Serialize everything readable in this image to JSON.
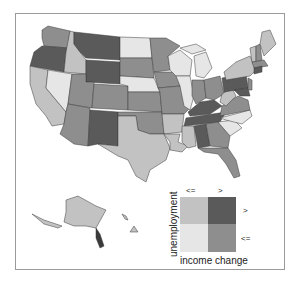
{
  "map": {
    "title": "",
    "colors": {
      "unemp_le_income_le": "#e6e6e6",
      "unemp_gt_income_le": "#c2c2c2",
      "unemp_le_income_gt": "#8e8e8e",
      "unemp_gt_income_gt": "#5a5a5a"
    },
    "legend": {
      "y_label": "unemployment",
      "x_label": "income change",
      "col_le": "<=",
      "col_gt": ">",
      "row_gt": ">",
      "row_le": "<="
    }
  }
}
